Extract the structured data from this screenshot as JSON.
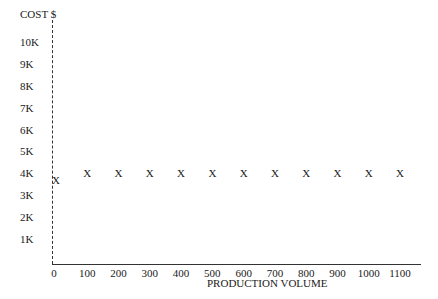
{
  "chart_data": {
    "type": "scatter",
    "title": "",
    "xlabel": "PRODUCTION VOLUME",
    "ylabel": "COST $",
    "x_ticks": [
      "0",
      "100",
      "200",
      "300",
      "400",
      "500",
      "600",
      "700",
      "800",
      "900",
      "1000",
      "1100"
    ],
    "y_ticks": [
      "1K",
      "2K",
      "3K",
      "4K",
      "5K",
      "6K",
      "7K",
      "8K",
      "9K",
      "10K"
    ],
    "xlim": [
      0,
      1100
    ],
    "ylim": [
      0,
      10000
    ],
    "grid": false,
    "marker": "X",
    "series": [
      {
        "name": "Cost",
        "x": [
          0,
          100,
          200,
          300,
          400,
          500,
          600,
          700,
          800,
          900,
          1000,
          1100
        ],
        "y": [
          3700,
          4000,
          4000,
          4000,
          4000,
          4000,
          4000,
          4000,
          4000,
          4000,
          4000,
          4000
        ]
      }
    ]
  },
  "labels": {
    "y_title": "COST $",
    "x_title": "PRODUCTION VOLUME",
    "marker": "X"
  }
}
